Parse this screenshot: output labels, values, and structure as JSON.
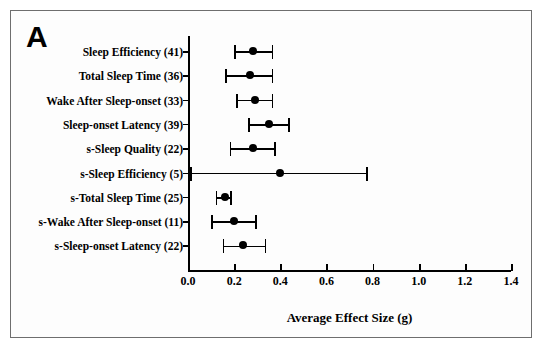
{
  "figure": {
    "panel_label": "A",
    "background": "#ffffff",
    "marker_color": "#000000",
    "border_color": "#6e6e6e"
  },
  "chart_data": {
    "type": "scatter",
    "title": "",
    "subtitle": "",
    "xlabel": "Average Effect Size (g)",
    "ylabel": "",
    "xlim": [
      0.0,
      1.4
    ],
    "xticks": [
      "0.0",
      "0.2",
      "0.4",
      "0.6",
      "0.8",
      "1.0",
      "1.2",
      "1.4"
    ],
    "xtick_values": [
      0.0,
      0.2,
      0.4,
      0.6,
      0.8,
      1.0,
      1.2,
      1.4
    ],
    "grid": false,
    "legend": "none",
    "categories": [
      "Sleep Efficiency (41)",
      "Total Sleep Time (36)",
      "Wake After Sleep-onset (33)",
      "Sleep-onset Latency (39)",
      "s-Sleep Quality (22)",
      "s-Sleep Efficiency (5)",
      "s-Total Sleep Time (25)",
      "s-Wake After Sleep-onset (11)",
      "s-Sleep-onset Latency (22)"
    ],
    "values": [
      0.28,
      0.27,
      0.29,
      0.35,
      0.28,
      0.4,
      0.16,
      0.2,
      0.24
    ],
    "ci_low": [
      0.2,
      0.16,
      0.21,
      0.26,
      0.18,
      0.01,
      0.12,
      0.1,
      0.15
    ],
    "ci_high": [
      0.37,
      0.37,
      0.37,
      0.44,
      0.38,
      0.78,
      0.19,
      0.3,
      0.34
    ],
    "rows": [
      {
        "label": "Sleep Efficiency (41)",
        "k": 41,
        "value": 0.28,
        "ci_low": 0.2,
        "ci_high": 0.37
      },
      {
        "label": "Total Sleep Time (36)",
        "k": 36,
        "value": 0.27,
        "ci_low": 0.16,
        "ci_high": 0.37
      },
      {
        "label": "Wake After Sleep-onset (33)",
        "k": 33,
        "value": 0.29,
        "ci_low": 0.21,
        "ci_high": 0.37
      },
      {
        "label": "Sleep-onset Latency (39)",
        "k": 39,
        "value": 0.35,
        "ci_low": 0.26,
        "ci_high": 0.44
      },
      {
        "label": "s-Sleep Quality (22)",
        "k": 22,
        "value": 0.28,
        "ci_low": 0.18,
        "ci_high": 0.38
      },
      {
        "label": "s-Sleep Efficiency (5)",
        "k": 5,
        "value": 0.4,
        "ci_low": 0.01,
        "ci_high": 0.78
      },
      {
        "label": "s-Total Sleep Time (25)",
        "k": 25,
        "value": 0.16,
        "ci_low": 0.12,
        "ci_high": 0.19
      },
      {
        "label": "s-Wake After Sleep-onset (11)",
        "k": 11,
        "value": 0.2,
        "ci_low": 0.1,
        "ci_high": 0.3
      },
      {
        "label": "s-Sleep-onset Latency (22)",
        "k": 22,
        "value": 0.24,
        "ci_low": 0.15,
        "ci_high": 0.34
      }
    ]
  }
}
